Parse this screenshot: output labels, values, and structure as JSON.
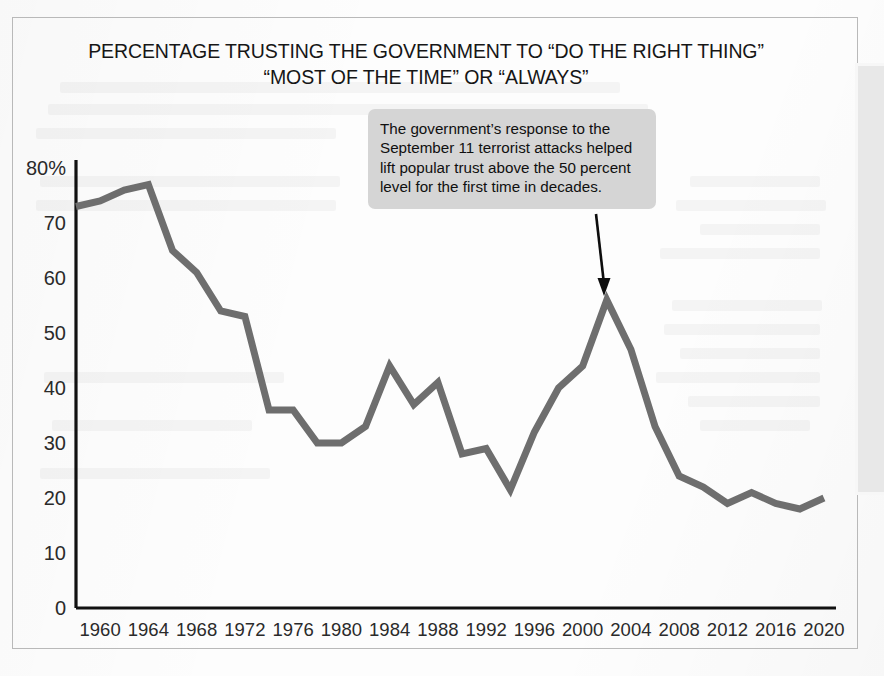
{
  "figure": {
    "title": "PERCENTAGE TRUSTING THE GOVERNMENT TO “DO THE RIGHT THING”\n“MOST OF THE TIME” OR “ALWAYS”",
    "annotation": "The government’s response to the September 11 terrorist attacks helped lift popular trust above the 50 percent level for the first time in decades.",
    "line_color": "#6e6e6e",
    "axis_color": "#111111",
    "annotation_bg": "#d5d5d5",
    "annotation_arrow_color": "#0d0d0d"
  },
  "chart_data": {
    "type": "line",
    "title": "PERCENTAGE TRUSTING THE GOVERNMENT TO “DO THE RIGHT THING” “MOST OF THE TIME” OR “ALWAYS”",
    "xlabel": "",
    "ylabel": "",
    "xlim": [
      1958,
      2021
    ],
    "ylim": [
      0,
      80
    ],
    "grid": false,
    "legend": false,
    "ytick_labels": [
      "0",
      "10",
      "20",
      "30",
      "40",
      "50",
      "60",
      "70",
      "80%"
    ],
    "ytick_values": [
      0,
      10,
      20,
      30,
      40,
      50,
      60,
      70,
      80
    ],
    "xtick_labels": [
      "1960",
      "1964",
      "1968",
      "1972",
      "1976",
      "1980",
      "1984",
      "1988",
      "1992",
      "1996",
      "2000",
      "2004",
      "2008",
      "2012",
      "2016",
      "2020"
    ],
    "xtick_values": [
      1960,
      1964,
      1968,
      1972,
      1976,
      1980,
      1984,
      1988,
      1992,
      1996,
      2000,
      2004,
      2008,
      2012,
      2016,
      2020
    ],
    "x": [
      1958,
      1960,
      1962,
      1964,
      1966,
      1968,
      1970,
      1972,
      1974,
      1976,
      1978,
      1980,
      1982,
      1984,
      1986,
      1988,
      1990,
      1992,
      1994,
      1996,
      1998,
      2000,
      2002,
      2004,
      2006,
      2008,
      2010,
      2012,
      2014,
      2016,
      2018,
      2020
    ],
    "y": [
      73,
      74,
      76,
      77,
      65,
      61,
      54,
      53,
      36,
      36,
      30,
      30,
      33,
      44,
      37,
      41,
      28,
      29,
      21.5,
      32,
      40,
      44,
      56,
      47,
      33,
      24,
      22,
      19,
      21,
      19,
      18,
      20
    ],
    "series": [
      {
        "name": "Trust in government",
        "values": [
          73,
          74,
          76,
          77,
          65,
          61,
          54,
          53,
          36,
          36,
          30,
          30,
          33,
          44,
          37,
          41,
          28,
          29,
          21.5,
          32,
          40,
          44,
          56,
          47,
          33,
          24,
          22,
          19,
          21,
          19,
          18,
          20
        ]
      }
    ],
    "annotations": [
      {
        "text": "The government’s response to the September 11 terrorist attacks helped lift popular trust above the 50 percent level for the first time in decades.",
        "points_to_x": 2002,
        "points_to_y": 56
      }
    ]
  }
}
